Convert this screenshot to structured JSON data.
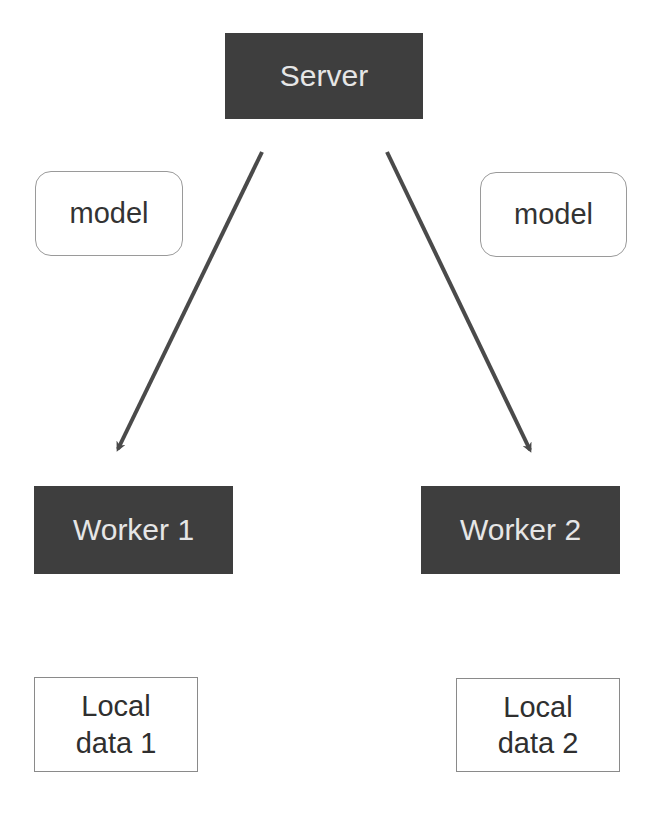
{
  "diagram": {
    "server": {
      "label": "Server"
    },
    "models": [
      {
        "label": "model"
      },
      {
        "label": "model"
      }
    ],
    "workers": [
      {
        "label": "Worker 1"
      },
      {
        "label": "Worker 2"
      }
    ],
    "local_data": [
      {
        "line1": "Local",
        "line2": "data 1"
      },
      {
        "line1": "Local",
        "line2": "data 2"
      }
    ],
    "edges": [
      {
        "from": "Server",
        "to": "Worker 1"
      },
      {
        "from": "Server",
        "to": "Worker 2"
      }
    ],
    "colors": {
      "dark_box": "#3e3e3e",
      "dark_box_text": "#e6e6e6",
      "arrow": "#4a4a4a",
      "border": "#9a9a9a"
    }
  }
}
